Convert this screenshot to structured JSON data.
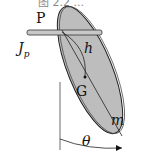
{
  "caption_partial": "图 2.2  ...",
  "labels": {
    "pivot": "P",
    "inertia": "J",
    "inertia_sub": "p",
    "distance": "h",
    "center": "G",
    "mass": "m",
    "angle": "θ"
  },
  "colors": {
    "body_fill": "#bdbdbd",
    "outline": "#222222",
    "rod_fill": "#c8c8c8"
  }
}
